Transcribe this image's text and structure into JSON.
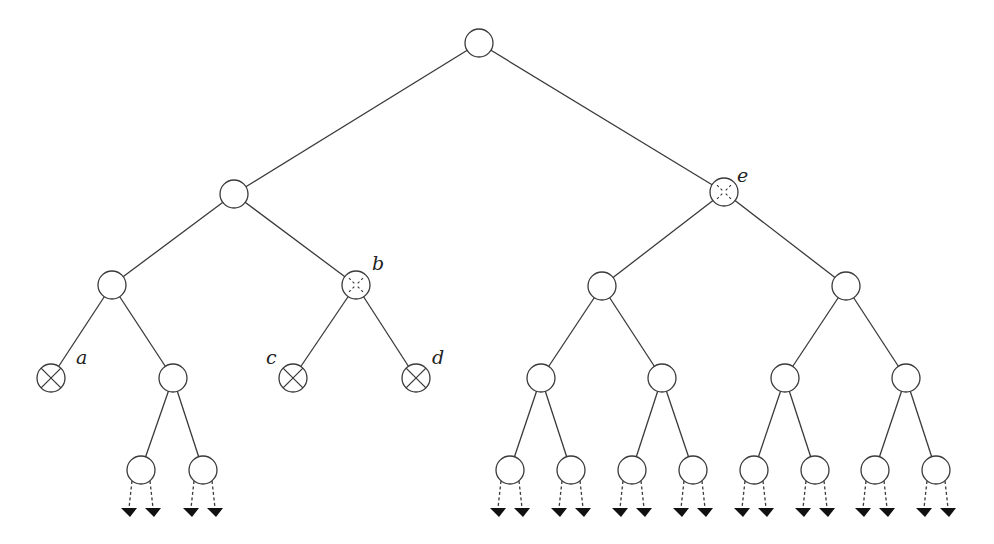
{
  "diagram": {
    "type": "binary-tree",
    "node_radius": 14,
    "colors": {
      "stroke": "#3a3a3a",
      "fill": "#ffffff",
      "arrow": "#111111",
      "label": "#222222"
    },
    "nodes": [
      {
        "id": "root",
        "x": 479,
        "y": 43,
        "mark": "none"
      },
      {
        "id": "L",
        "x": 234,
        "y": 194,
        "mark": "none"
      },
      {
        "id": "e",
        "x": 724,
        "y": 192,
        "mark": "dashed-cross",
        "label": "e",
        "lx": 737,
        "ly": 182
      },
      {
        "id": "LL",
        "x": 112,
        "y": 285,
        "mark": "none"
      },
      {
        "id": "b",
        "x": 356,
        "y": 285,
        "mark": "dashed-cross",
        "label": "b",
        "lx": 372,
        "ly": 270
      },
      {
        "id": "eL",
        "x": 602,
        "y": 286,
        "mark": "none"
      },
      {
        "id": "eR",
        "x": 846,
        "y": 286,
        "mark": "none"
      },
      {
        "id": "a",
        "x": 51,
        "y": 378,
        "mark": "cross",
        "label": "a",
        "lx": 76,
        "ly": 364
      },
      {
        "id": "LLR",
        "x": 173,
        "y": 378,
        "mark": "none"
      },
      {
        "id": "c",
        "x": 293,
        "y": 378,
        "mark": "cross",
        "label": "c",
        "lx": 266,
        "ly": 364
      },
      {
        "id": "d",
        "x": 416,
        "y": 378,
        "mark": "cross",
        "label": "d",
        "lx": 432,
        "ly": 364
      },
      {
        "id": "eLL",
        "x": 541,
        "y": 378,
        "mark": "none"
      },
      {
        "id": "eLR",
        "x": 662,
        "y": 378,
        "mark": "none"
      },
      {
        "id": "eRL",
        "x": 785,
        "y": 378,
        "mark": "none"
      },
      {
        "id": "eRR",
        "x": 906,
        "y": 378,
        "mark": "none"
      },
      {
        "id": "n1",
        "x": 141,
        "y": 470,
        "mark": "none",
        "frontier": true
      },
      {
        "id": "n2",
        "x": 203,
        "y": 470,
        "mark": "none",
        "frontier": true
      },
      {
        "id": "n3",
        "x": 510,
        "y": 470,
        "mark": "none",
        "frontier": true
      },
      {
        "id": "n4",
        "x": 571,
        "y": 470,
        "mark": "none",
        "frontier": true
      },
      {
        "id": "n5",
        "x": 632,
        "y": 470,
        "mark": "none",
        "frontier": true
      },
      {
        "id": "n6",
        "x": 693,
        "y": 470,
        "mark": "none",
        "frontier": true
      },
      {
        "id": "n7",
        "x": 754,
        "y": 470,
        "mark": "none",
        "frontier": true
      },
      {
        "id": "n8",
        "x": 815,
        "y": 470,
        "mark": "none",
        "frontier": true
      },
      {
        "id": "n9",
        "x": 875,
        "y": 470,
        "mark": "none",
        "frontier": true
      },
      {
        "id": "n10",
        "x": 936,
        "y": 470,
        "mark": "none",
        "frontier": true
      }
    ],
    "edges": [
      [
        "root",
        "L"
      ],
      [
        "root",
        "e"
      ],
      [
        "L",
        "LL"
      ],
      [
        "L",
        "b"
      ],
      [
        "e",
        "eL"
      ],
      [
        "e",
        "eR"
      ],
      [
        "LL",
        "a"
      ],
      [
        "LL",
        "LLR"
      ],
      [
        "b",
        "c"
      ],
      [
        "b",
        "d"
      ],
      [
        "eL",
        "eLL"
      ],
      [
        "eL",
        "eLR"
      ],
      [
        "eR",
        "eRL"
      ],
      [
        "eR",
        "eRR"
      ],
      [
        "LLR",
        "n1"
      ],
      [
        "LLR",
        "n2"
      ],
      [
        "eLL",
        "n3"
      ],
      [
        "eLL",
        "n4"
      ],
      [
        "eLR",
        "n5"
      ],
      [
        "eLR",
        "n6"
      ],
      [
        "eRL",
        "n7"
      ],
      [
        "eRL",
        "n8"
      ],
      [
        "eRR",
        "n9"
      ],
      [
        "eRR",
        "n10"
      ]
    ],
    "labels": [
      "a",
      "b",
      "c",
      "d",
      "e"
    ]
  }
}
